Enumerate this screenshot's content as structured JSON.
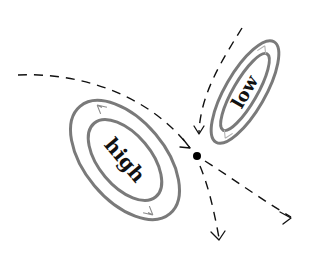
{
  "diagram": {
    "type": "phase-portrait",
    "colors": {
      "ring": "#7a7a7a",
      "flow": "#111111",
      "point": "#000000",
      "background": "#ffffff"
    },
    "regions": [
      {
        "id": "high",
        "label": "high",
        "center": [
          125,
          160
        ],
        "rotation_deg": 50,
        "outer_radii": [
          70,
          40
        ],
        "inner_radii": [
          48,
          26
        ]
      },
      {
        "id": "low",
        "label": "low",
        "center": [
          245,
          92
        ],
        "rotation_deg": -60,
        "outer_radii": [
          58,
          20
        ],
        "inner_radii": [
          44,
          12
        ]
      }
    ],
    "fixed_point": {
      "label": "",
      "position": [
        197,
        156
      ]
    },
    "flows": [
      {
        "id": "incoming-left",
        "direction": "in"
      },
      {
        "id": "incoming-top",
        "direction": "in"
      },
      {
        "id": "outgoing-right",
        "direction": "out"
      },
      {
        "id": "outgoing-down",
        "direction": "out"
      }
    ]
  }
}
